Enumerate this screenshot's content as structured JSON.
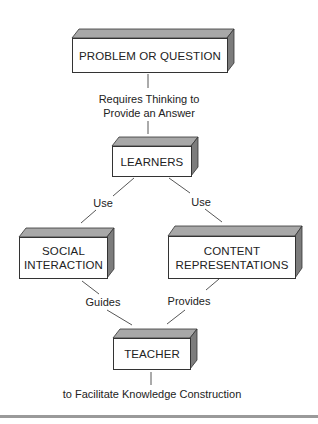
{
  "diagram": {
    "nodes": [
      {
        "id": "problem",
        "label": "PROBLEM OR QUESTION"
      },
      {
        "id": "learners",
        "label": "LEARNERS"
      },
      {
        "id": "social",
        "line1": "SOCIAL",
        "line2": "INTERACTION"
      },
      {
        "id": "content",
        "line1": "CONTENT",
        "line2": "REPRESENTATIONS"
      },
      {
        "id": "teacher",
        "label": "TEACHER"
      }
    ],
    "edges": [
      {
        "from": "problem",
        "to": "learners",
        "line1": "Requires Thinking to",
        "line2": "Provide an Answer"
      },
      {
        "from": "learners",
        "to": "social",
        "label": "Use"
      },
      {
        "from": "learners",
        "to": "content",
        "label": "Use"
      },
      {
        "from": "social",
        "to": "teacher",
        "label": "Guides"
      },
      {
        "from": "content",
        "to": "teacher",
        "label": "Provides"
      }
    ],
    "footer_text": "to Facilitate Knowledge Construction",
    "colors": {
      "top_face": "#9c9c9c",
      "side_face": "#7a7a7a",
      "outline": "#333333",
      "rule": "#9a9a9a"
    }
  }
}
